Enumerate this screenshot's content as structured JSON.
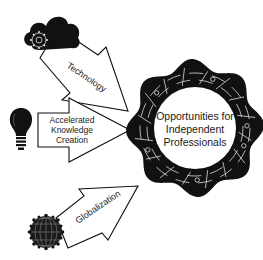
{
  "diagram": {
    "center": {
      "icon": "gear-circuit-badge-icon",
      "lines": [
        "Opportunities for",
        "Independent",
        "Professionals"
      ]
    },
    "drivers": [
      {
        "id": "technology",
        "icon": "cloud-gear-icon",
        "label": "Technology"
      },
      {
        "id": "knowledge",
        "icon": "lightbulb-icon",
        "lines": [
          "Accelerated",
          "Knowledge",
          "Creation"
        ]
      },
      {
        "id": "globalization",
        "icon": "globe-icon",
        "label": "Globalization"
      }
    ],
    "colors": {
      "ink": "#111111",
      "background": "#ffffff",
      "text": "#222222"
    }
  }
}
